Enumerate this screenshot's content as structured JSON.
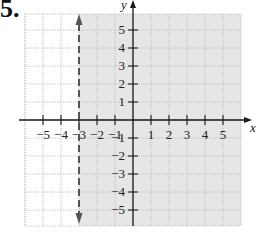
{
  "problem_number": "5.",
  "chart_data": {
    "type": "inequality-graph",
    "title": "",
    "xlabel": "x",
    "ylabel": "y",
    "xlim": [
      -6,
      6
    ],
    "ylim": [
      -6,
      6
    ],
    "grid": true,
    "x_ticks": [
      -5,
      -4,
      -3,
      -2,
      -1,
      1,
      2,
      3,
      4,
      5
    ],
    "y_ticks": [
      -5,
      -4,
      -3,
      -2,
      -1,
      1,
      2,
      3,
      4,
      5
    ],
    "x_tick_labels": [
      "−5",
      "−4",
      "−3",
      "−2",
      "−1",
      "1",
      "2",
      "3",
      "4",
      "5"
    ],
    "y_tick_labels": [
      "−5",
      "−4",
      "−3",
      "−2",
      "−1",
      "1",
      "2",
      "3",
      "4",
      "5"
    ],
    "boundary": {
      "equation": "x = -3",
      "style": "dashed",
      "arrows": "both"
    },
    "shaded_region": "x > -3",
    "inequality": "x > -3",
    "colors": {
      "shade": "#e6e6e6",
      "grid": "#b5b5b5",
      "axis": "#1a1a1a",
      "boundary": "#555555"
    }
  }
}
